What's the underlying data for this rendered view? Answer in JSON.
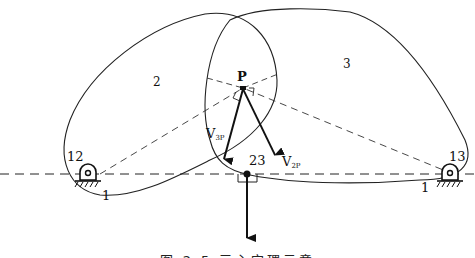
{
  "diagram": {
    "labels": {
      "body_left": "2",
      "body_right": "3",
      "point_p": "P",
      "pivot_left": "12",
      "pivot_right": "13",
      "ground_left": "1",
      "ground_right": "1",
      "slider": "23",
      "v_left": "V",
      "v_left_sub": "3P",
      "v_right": "V",
      "v_right_sub": "2P"
    },
    "caption": "图 2.5  三心定理示意"
  }
}
